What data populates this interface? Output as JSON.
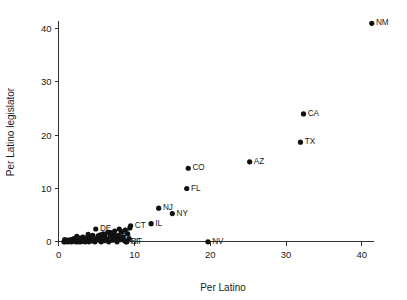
{
  "chart_data": {
    "type": "scatter",
    "title": "",
    "xlabel": "Per Latino",
    "ylabel": "Per Latino legislator",
    "xlim": [
      -1.2,
      44.5
    ],
    "ylim": [
      -2.2,
      43.5
    ],
    "xticks": [
      0,
      10,
      20,
      30,
      40
    ],
    "yticks": [
      0,
      10,
      20,
      30,
      40
    ],
    "xticklabels": [
      "0",
      "10",
      "20",
      "30",
      "40"
    ],
    "yticklabels": [
      "0",
      "10",
      "20",
      "30",
      "40"
    ],
    "grid": false,
    "legend": null,
    "marker": "filled-circle",
    "marker_color": "#111111",
    "points": [
      {
        "label": "NM",
        "x": 41.3,
        "y": 41.0
      },
      {
        "label": "CA",
        "x": 32.3,
        "y": 24.0
      },
      {
        "label": "TX",
        "x": 31.9,
        "y": 18.7
      },
      {
        "label": "AZ",
        "x": 25.2,
        "y": 15.0
      },
      {
        "label": "CO",
        "x": 17.1,
        "y": 13.8
      },
      {
        "label": "FL",
        "x": 16.9,
        "y": 10.0
      },
      {
        "label": "NJ",
        "x": 13.2,
        "y": 6.3
      },
      {
        "label": "NY",
        "x": 15.0,
        "y": 5.3
      },
      {
        "label": "IL",
        "x": 12.2,
        "y": 3.4
      },
      {
        "label": "CT",
        "x": 9.5,
        "y": 3.0
      },
      {
        "label": "NV",
        "x": 19.7,
        "y": 0.0
      },
      {
        "label": "DE",
        "x": 4.9,
        "y": 2.4
      },
      {
        "label": "RI",
        "x": 8.9,
        "y": 0.0
      },
      {
        "label": "UT",
        "x": 9.0,
        "y": 0.0
      },
      {
        "label": "MA",
        "x": 7.3,
        "y": 1.4
      },
      {
        "label": "IN",
        "x": 6.2,
        "y": 0.6
      },
      {
        "label": "KS",
        "x": 7.0,
        "y": 0.9
      },
      {
        "label": "",
        "x": 0.7,
        "y": 0.0
      },
      {
        "label": "",
        "x": 0.9,
        "y": 0.0
      },
      {
        "label": "",
        "x": 1.1,
        "y": 0.1
      },
      {
        "label": "",
        "x": 1.3,
        "y": 0.0
      },
      {
        "label": "",
        "x": 1.5,
        "y": 0.2
      },
      {
        "label": "",
        "x": 1.7,
        "y": 0.0
      },
      {
        "label": "",
        "x": 1.9,
        "y": 0.3
      },
      {
        "label": "",
        "x": 2.1,
        "y": 0.1
      },
      {
        "label": "",
        "x": 2.3,
        "y": 0.0
      },
      {
        "label": "",
        "x": 2.5,
        "y": 0.4
      },
      {
        "label": "",
        "x": 2.7,
        "y": 0.2
      },
      {
        "label": "",
        "x": 2.9,
        "y": 0.0
      },
      {
        "label": "",
        "x": 2.4,
        "y": 1.0
      },
      {
        "label": "",
        "x": 3.1,
        "y": 0.5
      },
      {
        "label": "",
        "x": 3.3,
        "y": 0.1
      },
      {
        "label": "",
        "x": 3.5,
        "y": 0.0
      },
      {
        "label": "",
        "x": 3.6,
        "y": 0.7
      },
      {
        "label": "",
        "x": 3.8,
        "y": 0.3
      },
      {
        "label": "",
        "x": 4.0,
        "y": 0.0
      },
      {
        "label": "",
        "x": 4.2,
        "y": 0.9
      },
      {
        "label": "",
        "x": 4.4,
        "y": 0.4
      },
      {
        "label": "",
        "x": 4.6,
        "y": 0.1
      },
      {
        "label": "",
        "x": 4.8,
        "y": 0.0
      },
      {
        "label": "",
        "x": 5.0,
        "y": 0.6
      },
      {
        "label": "",
        "x": 5.2,
        "y": 1.1
      },
      {
        "label": "",
        "x": 5.4,
        "y": 0.3
      },
      {
        "label": "",
        "x": 5.6,
        "y": 0.0
      },
      {
        "label": "",
        "x": 5.8,
        "y": 0.8
      },
      {
        "label": "",
        "x": 6.0,
        "y": 0.2
      },
      {
        "label": "",
        "x": 6.1,
        "y": 1.3
      },
      {
        "label": "",
        "x": 6.4,
        "y": 0.5
      },
      {
        "label": "",
        "x": 6.6,
        "y": 0.0
      },
      {
        "label": "",
        "x": 6.8,
        "y": 1.0
      },
      {
        "label": "",
        "x": 7.1,
        "y": 0.3
      },
      {
        "label": "",
        "x": 7.2,
        "y": 1.6
      },
      {
        "label": "",
        "x": 7.5,
        "y": 0.7
      },
      {
        "label": "",
        "x": 7.7,
        "y": 0.0
      },
      {
        "label": "",
        "x": 7.9,
        "y": 1.2
      },
      {
        "label": "",
        "x": 8.1,
        "y": 0.4
      },
      {
        "label": "",
        "x": 8.3,
        "y": 1.9
      },
      {
        "label": "",
        "x": 8.5,
        "y": 0.9
      },
      {
        "label": "",
        "x": 8.7,
        "y": 0.2
      },
      {
        "label": "",
        "x": 8.8,
        "y": 2.2
      },
      {
        "label": "",
        "x": 9.1,
        "y": 1.5
      },
      {
        "label": "",
        "x": 9.3,
        "y": 0.6
      },
      {
        "label": "",
        "x": 9.4,
        "y": 2.6
      },
      {
        "label": "",
        "x": 6.5,
        "y": 1.8
      },
      {
        "label": "",
        "x": 5.9,
        "y": 1.5
      },
      {
        "label": "",
        "x": 4.5,
        "y": 1.2
      },
      {
        "label": "",
        "x": 3.9,
        "y": 1.4
      },
      {
        "label": "",
        "x": 3.2,
        "y": 0.9
      },
      {
        "label": "",
        "x": 2.8,
        "y": 0.7
      },
      {
        "label": "",
        "x": 2.0,
        "y": 0.6
      },
      {
        "label": "",
        "x": 1.6,
        "y": 0.4
      },
      {
        "label": "",
        "x": 1.2,
        "y": 0.3
      },
      {
        "label": "",
        "x": 7.4,
        "y": 2.0
      },
      {
        "label": "",
        "x": 8.0,
        "y": 2.4
      },
      {
        "label": "",
        "x": 6.9,
        "y": 1.7
      },
      {
        "label": "",
        "x": 5.5,
        "y": 1.3
      },
      {
        "label": "",
        "x": 4.1,
        "y": 0.5
      },
      {
        "label": "",
        "x": 3.4,
        "y": 0.2
      },
      {
        "label": "",
        "x": 2.6,
        "y": 0.0
      },
      {
        "label": "",
        "x": 1.8,
        "y": 0.1
      },
      {
        "label": "",
        "x": 1.0,
        "y": 0.2
      },
      {
        "label": "",
        "x": 0.8,
        "y": 0.4
      }
    ]
  },
  "plot_geometry": {
    "left": 49.5,
    "right": 396.0,
    "top": 10.0,
    "bottom": 253.5
  }
}
